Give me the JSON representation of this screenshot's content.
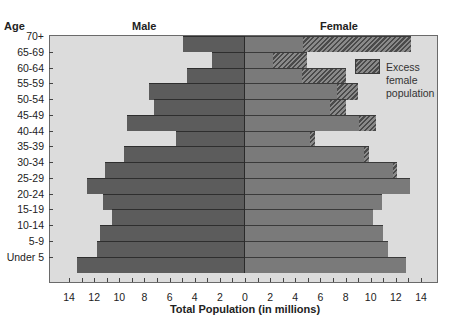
{
  "titles": {
    "age": "Age",
    "male": "Male",
    "female": "Female",
    "xaxis": "Total Population (in millions)"
  },
  "legend": {
    "lines": [
      "Excess",
      "female",
      "population"
    ]
  },
  "chart_data": {
    "type": "bar",
    "subtype": "population-pyramid",
    "title": "",
    "xlabel": "Total Population (in millions)",
    "ylabel": "Age",
    "xlim": [
      -14,
      14
    ],
    "x_ticks": [
      14,
      12,
      10,
      8,
      6,
      4,
      2,
      0,
      2,
      4,
      6,
      8,
      10,
      12,
      14
    ],
    "categories": [
      "70+",
      "65-69",
      "60-64",
      "55-59",
      "50-54",
      "45-49",
      "40-44",
      "35-39",
      "30-34",
      "25-29",
      "20-24",
      "15-19",
      "10-14",
      "5-9",
      "Under 5"
    ],
    "series": [
      {
        "name": "Male",
        "side": "left",
        "values": [
          4.9,
          2.6,
          4.6,
          7.6,
          7.2,
          9.4,
          5.5,
          9.6,
          11.1,
          12.6,
          11.3,
          10.6,
          11.5,
          11.8,
          13.4
        ]
      },
      {
        "name": "Female (matching male)",
        "side": "right",
        "values": [
          4.6,
          2.2,
          4.5,
          7.3,
          6.8,
          9.1,
          5.2,
          9.5,
          11.8,
          13.1,
          10.9,
          10.2,
          11.0,
          11.4,
          12.8
        ]
      },
      {
        "name": "Female total",
        "side": "right",
        "values": [
          13.2,
          4.9,
          8.0,
          9.0,
          8.0,
          10.4,
          5.6,
          9.9,
          12.1,
          13.1,
          10.9,
          10.2,
          11.0,
          11.4,
          12.8
        ]
      },
      {
        "name": "Excess female population",
        "side": "right",
        "values": [
          8.6,
          2.7,
          3.5,
          1.7,
          1.2,
          1.3,
          0.4,
          0.4,
          0.3,
          0,
          0,
          0,
          0,
          0,
          0
        ]
      }
    ],
    "legend": {
      "entries": [
        "Excess female population"
      ],
      "position": "upper-right inside"
    },
    "grid": false
  }
}
